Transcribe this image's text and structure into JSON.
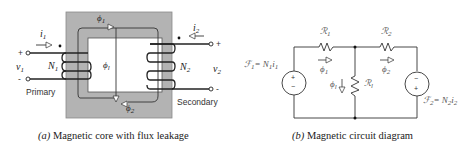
{
  "figure_a": {
    "caption_prefix": "(a)",
    "caption_text": "Magnetic core with flux leakage",
    "labels": {
      "i1": "i",
      "i1_sub": "1",
      "i2": "i",
      "i2_sub": "2",
      "v1": "v",
      "v1_sub": "1",
      "v2": "v",
      "v2_sub": "2",
      "N1": "N",
      "N1_sub": "1",
      "N2": "N",
      "N2_sub": "2",
      "phi1": "ϕ",
      "phi1_sub": "1",
      "phi2": "ϕ",
      "phi2_sub": "2",
      "phil": "ϕ",
      "phil_sub": "l",
      "plus_left": "+",
      "minus_left": "-",
      "plus_right": "+",
      "minus_right": "-",
      "primary": "Primary",
      "secondary": "Secondary"
    },
    "colors": {
      "core": "#b3b3b3",
      "core_edge": "#777777",
      "wire": "#222222"
    }
  },
  "figure_b": {
    "caption_prefix": "(b)",
    "caption_text": "Magnetic circuit diagram",
    "labels": {
      "R1": "ℛ",
      "R1_sub": "1",
      "R2": "ℛ",
      "R2_sub": "2",
      "Rl": "ℛ",
      "Rl_sub": "l",
      "phi1": "ϕ",
      "phi1_sub": "1",
      "phi2": "ϕ",
      "phi2_sub": "2",
      "phil": "ϕ",
      "phil_sub": "l",
      "F1_lhs": "ℱ",
      "F1_lhs_sub": "1",
      "F1_rhs": "= N",
      "F1_rhs_sub": "1",
      "F1_tail": "i",
      "F1_tail_sub": "1",
      "F2_lhs": "ℱ",
      "F2_lhs_sub": "2",
      "F2_rhs": "= N",
      "F2_rhs_sub": "2",
      "F2_tail": "i",
      "F2_tail_sub": "2",
      "src1_top": "+",
      "src1_bottom": "−",
      "src2_top": "−",
      "src2_bottom": "+"
    }
  }
}
